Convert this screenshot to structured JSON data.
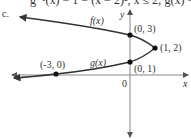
{
  "header": {
    "top_line_partial": "g⁻¹(x) = 1 − (x − 2)², x ≤ 2; g(x) = 2 − √(1 − x)",
    "part_label": "c."
  },
  "graph": {
    "axes": {
      "x_label": "x",
      "y_label": "y",
      "origin_label": "0"
    },
    "curves": [
      {
        "name": "f",
        "label": "f(x)",
        "description": "upper branch of sideways parabola opening left, from (1,2) through (0,3) toward upper-left"
      },
      {
        "name": "g",
        "label": "g(x)",
        "description": "lower branch from (1,2) through (0,1) and (-3,0) toward lower-left"
      }
    ],
    "points": [
      {
        "label": "(0, 3)",
        "x": 0,
        "y": 3
      },
      {
        "label": "(1, 2)",
        "x": 1,
        "y": 2
      },
      {
        "label": "(0, 1)",
        "x": 0,
        "y": 1
      },
      {
        "label": "(-3, 0)",
        "x": -3,
        "y": 0
      }
    ],
    "colors": {
      "curve": "#333333",
      "axis": "#666666",
      "point": "#111111"
    }
  }
}
